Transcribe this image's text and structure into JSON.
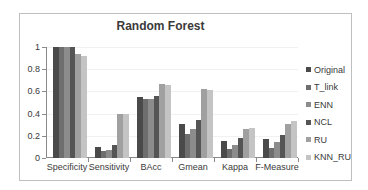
{
  "chart_data": {
    "type": "bar",
    "title": "Random Forest",
    "xlabel": "",
    "ylabel": "",
    "ylim": [
      0,
      1
    ],
    "yticks": [
      "0",
      "0.2",
      "0.4",
      "0.6",
      "0.8",
      "1"
    ],
    "grid": true,
    "legend_position": "right",
    "categories": [
      "Specificity",
      "Sensitivity",
      "BAcc",
      "Gmean",
      "Kappa",
      "F-Measure"
    ],
    "series": [
      {
        "name": "Original",
        "color": "#4a4a4a",
        "values": [
          1.0,
          0.1,
          0.55,
          0.31,
          0.15,
          0.17
        ]
      },
      {
        "name": "T_link",
        "color": "#6e6e6e",
        "values": [
          1.0,
          0.06,
          0.53,
          0.22,
          0.08,
          0.09
        ]
      },
      {
        "name": "ENN",
        "color": "#8c8c8c",
        "values": [
          1.0,
          0.07,
          0.53,
          0.26,
          0.12,
          0.14
        ]
      },
      {
        "name": "NCL",
        "color": "#555555",
        "values": [
          1.0,
          0.12,
          0.56,
          0.34,
          0.18,
          0.21
        ]
      },
      {
        "name": "RU",
        "color": "#a0a0a0",
        "values": [
          0.94,
          0.4,
          0.67,
          0.62,
          0.26,
          0.31
        ]
      },
      {
        "name": "KNN_RU",
        "color": "#c4c4c4",
        "values": [
          0.92,
          0.4,
          0.66,
          0.61,
          0.27,
          0.33
        ]
      }
    ]
  }
}
